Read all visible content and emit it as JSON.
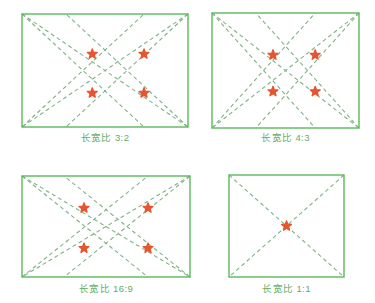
{
  "figure": {
    "name": "aspect-ratio-diagonal-composition-diagram",
    "background_color": "#ffffff",
    "frame_color": "#5cb85c",
    "line_color": "#7fb383",
    "marker_color": "#e8542f",
    "caption_color": "#63ad63"
  },
  "panels": [
    {
      "id": "panel-3-2",
      "caption": "长宽比 3:2",
      "ratio_label": "3:2",
      "ratio_w": 3,
      "ratio_h": 2,
      "box": {
        "x": 22,
        "y": 14,
        "w": 166,
        "h": 113
      },
      "caption_y": 132,
      "markers": [
        {
          "x": 0.4233,
          "y": 0.355
        },
        {
          "x": 0.7349,
          "y": 0.355
        },
        {
          "x": 0.4233,
          "y": 0.699
        },
        {
          "x": 0.7349,
          "y": 0.699
        }
      ],
      "lines": [
        {
          "from": [
            0,
            0
          ],
          "to": [
            1,
            1
          ],
          "kind": "main-diagonal"
        },
        {
          "from": [
            1,
            0
          ],
          "to": [
            0,
            1
          ],
          "kind": "main-diagonal"
        },
        {
          "from": [
            0,
            0
          ],
          "to": [
            0.7349,
            1
          ],
          "kind": "corner-ray"
        },
        {
          "from": [
            1,
            0
          ],
          "to": [
            0.2651,
            1
          ],
          "kind": "corner-ray"
        },
        {
          "from": [
            0,
            1
          ],
          "to": [
            0.7349,
            0
          ],
          "kind": "corner-ray"
        },
        {
          "from": [
            1,
            1
          ],
          "to": [
            0.2651,
            0
          ],
          "kind": "corner-ray"
        }
      ]
    },
    {
      "id": "panel-4-3",
      "caption": "长宽比 4:3",
      "ratio_label": "4:3",
      "ratio_w": 4,
      "ratio_h": 3,
      "box": {
        "x": 212,
        "y": 13,
        "w": 147,
        "h": 115
      },
      "caption_y": 132,
      "markers": [
        {
          "x": 0.415,
          "y": 0.365
        },
        {
          "x": 0.702,
          "y": 0.365
        },
        {
          "x": 0.415,
          "y": 0.683
        },
        {
          "x": 0.702,
          "y": 0.683
        }
      ],
      "lines": [
        {
          "from": [
            0,
            0
          ],
          "to": [
            1,
            1
          ],
          "kind": "main-diagonal"
        },
        {
          "from": [
            1,
            0
          ],
          "to": [
            0,
            1
          ],
          "kind": "main-diagonal"
        },
        {
          "from": [
            0,
            0
          ],
          "to": [
            0.702,
            1
          ],
          "kind": "corner-ray"
        },
        {
          "from": [
            1,
            0
          ],
          "to": [
            0.298,
            1
          ],
          "kind": "corner-ray"
        },
        {
          "from": [
            0,
            1
          ],
          "to": [
            0.702,
            0
          ],
          "kind": "corner-ray"
        },
        {
          "from": [
            1,
            1
          ],
          "to": [
            0.298,
            0
          ],
          "kind": "corner-ray"
        }
      ]
    },
    {
      "id": "panel-16-9",
      "caption": "长宽比 16:9",
      "ratio_label": "16:9",
      "ratio_w": 16,
      "ratio_h": 9,
      "box": {
        "x": 22,
        "y": 176,
        "w": 168,
        "h": 101
      },
      "caption_y": 283,
      "markers": [
        {
          "x": 0.369,
          "y": 0.317
        },
        {
          "x": 0.75,
          "y": 0.317
        },
        {
          "x": 0.369,
          "y": 0.715
        },
        {
          "x": 0.75,
          "y": 0.715
        }
      ],
      "lines": [
        {
          "from": [
            0,
            0
          ],
          "to": [
            1,
            1
          ],
          "kind": "main-diagonal"
        },
        {
          "from": [
            1,
            0
          ],
          "to": [
            0,
            1
          ],
          "kind": "main-diagonal"
        },
        {
          "from": [
            0,
            0
          ],
          "to": [
            0.75,
            1
          ],
          "kind": "corner-ray"
        },
        {
          "from": [
            1,
            0
          ],
          "to": [
            0.25,
            1
          ],
          "kind": "corner-ray"
        },
        {
          "from": [
            0,
            1
          ],
          "to": [
            0.75,
            0
          ],
          "kind": "corner-ray"
        },
        {
          "from": [
            1,
            1
          ],
          "to": [
            0.25,
            0
          ],
          "kind": "corner-ray"
        }
      ]
    },
    {
      "id": "panel-1-1",
      "caption": "长宽比 1:1",
      "ratio_label": "1:1",
      "ratio_w": 1,
      "ratio_h": 1,
      "box": {
        "x": 229,
        "y": 175,
        "w": 115,
        "h": 102
      },
      "caption_y": 283,
      "markers": [
        {
          "x": 0.5,
          "y": 0.5
        }
      ],
      "lines": [
        {
          "from": [
            0,
            0
          ],
          "to": [
            1,
            1
          ],
          "kind": "main-diagonal"
        },
        {
          "from": [
            1,
            0
          ],
          "to": [
            0,
            1
          ],
          "kind": "main-diagonal"
        }
      ]
    }
  ],
  "style": {
    "frame_stroke_width": 1.4,
    "line_stroke_width": 1.1,
    "dash_pattern": "4,3",
    "marker_radius": 5.2
  }
}
